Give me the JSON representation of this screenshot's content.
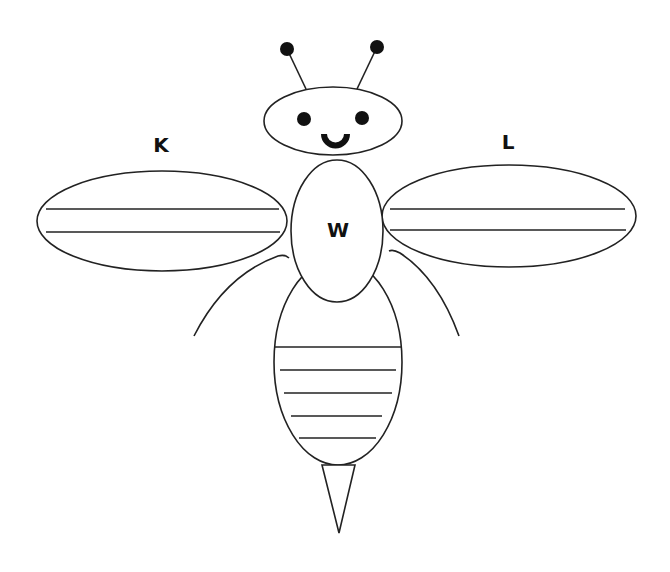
{
  "diagram": {
    "labels": {
      "left_wing": "K",
      "right_wing": "L",
      "thorax": "W"
    },
    "parts": [
      {
        "name": "antennae",
        "count": 2
      },
      {
        "name": "head",
        "features": [
          "two eyes",
          "smile"
        ]
      },
      {
        "name": "left wing",
        "label": "K",
        "vein_lines": 2
      },
      {
        "name": "right wing",
        "label": "L",
        "vein_lines": 2
      },
      {
        "name": "thorax",
        "label": "W"
      },
      {
        "name": "legs",
        "count": 2
      },
      {
        "name": "abdomen",
        "stripes": 5
      },
      {
        "name": "stinger"
      }
    ],
    "colors": {
      "stroke": "#222222",
      "fill": "#ffffff",
      "dots": "#111111"
    }
  }
}
